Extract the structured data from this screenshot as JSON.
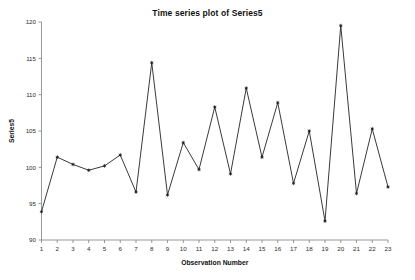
{
  "chart_data": {
    "type": "line",
    "title": "Time series plot of Series5",
    "xlabel": "Observation Number",
    "ylabel": "Series5",
    "x": [
      1,
      2,
      3,
      4,
      5,
      6,
      7,
      8,
      9,
      10,
      11,
      12,
      13,
      14,
      15,
      16,
      17,
      18,
      19,
      20,
      21,
      22,
      23
    ],
    "values": [
      93.9,
      101.4,
      100.4,
      99.6,
      100.2,
      101.7,
      96.6,
      114.4,
      96.2,
      103.4,
      99.7,
      108.3,
      99.1,
      110.9,
      101.4,
      108.9,
      97.8,
      105.0,
      92.6,
      119.5,
      96.4,
      105.3,
      97.3
    ],
    "series": [
      {
        "name": "Series5",
        "values": [
          93.9,
          101.4,
          100.4,
          99.6,
          100.2,
          101.7,
          96.6,
          114.4,
          96.2,
          103.4,
          99.7,
          108.3,
          99.1,
          110.9,
          101.4,
          108.9,
          97.8,
          105.0,
          92.6,
          119.5,
          96.4,
          105.3,
          97.3
        ]
      }
    ],
    "xlim": [
      1,
      23
    ],
    "ylim": [
      90,
      120
    ],
    "xticks": [
      "1",
      "2",
      "3",
      "4",
      "5",
      "6",
      "7",
      "8",
      "9",
      "10",
      "11",
      "12",
      "13",
      "14",
      "15",
      "16",
      "17",
      "18",
      "19",
      "20",
      "21",
      "22",
      "23"
    ],
    "yticks": [
      "90",
      "95",
      "100",
      "105",
      "110",
      "115",
      "120"
    ],
    "ytick_values": [
      90,
      95,
      100,
      105,
      110,
      115,
      120
    ],
    "grid": false,
    "legend": "none",
    "marker": "asterisk",
    "line_color": "#3a3a3a",
    "marker_color": "#1f1f1f",
    "axis_color": "#8c8c8c",
    "background": "#ffffff"
  }
}
